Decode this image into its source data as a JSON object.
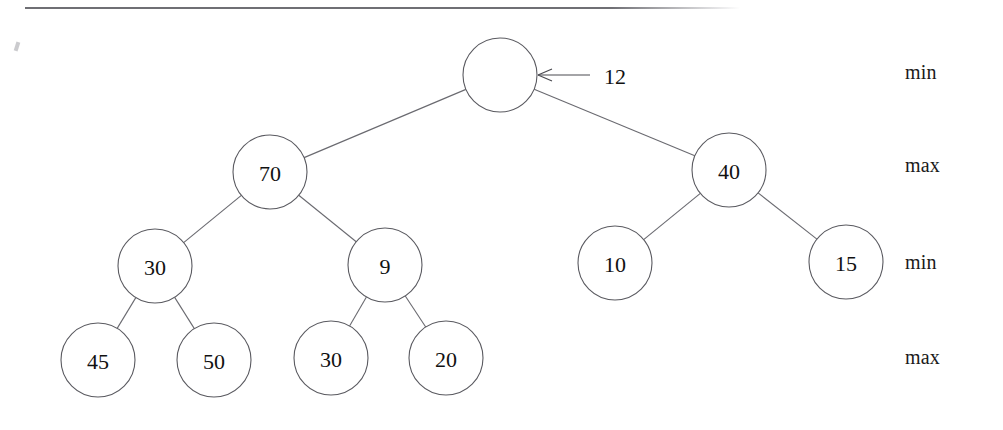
{
  "figure": {
    "background_color": "#ffffff",
    "node_stroke_color": "#5a5a60",
    "edge_stroke_color": "#6a6a70",
    "text_color": "#111111",
    "rule_color": "#6f6f74"
  },
  "pointer": {
    "label": "12",
    "target_node": "root",
    "arrow_direction": "left"
  },
  "level_labels": [
    {
      "text": "min",
      "y": 73
    },
    {
      "text": "max",
      "y": 166
    },
    {
      "text": "min",
      "y": 263
    },
    {
      "text": "max",
      "y": 358
    }
  ],
  "nodes": [
    {
      "id": "root",
      "label": "",
      "cx": 500,
      "cy": 75,
      "r": 37,
      "level": 0
    },
    {
      "id": "n70",
      "label": "70",
      "cx": 270,
      "cy": 172,
      "r": 37,
      "level": 1
    },
    {
      "id": "n40",
      "label": "40",
      "cx": 729,
      "cy": 170,
      "r": 37,
      "level": 1
    },
    {
      "id": "n30a",
      "label": "30",
      "cx": 155,
      "cy": 266,
      "r": 37,
      "level": 2
    },
    {
      "id": "n9",
      "label": "9",
      "cx": 385,
      "cy": 265,
      "r": 37,
      "level": 2
    },
    {
      "id": "n10",
      "label": "10",
      "cx": 615,
      "cy": 263,
      "r": 37,
      "level": 2
    },
    {
      "id": "n15",
      "label": "15",
      "cx": 846,
      "cy": 262,
      "r": 37,
      "level": 2
    },
    {
      "id": "n45",
      "label": "45",
      "cx": 98,
      "cy": 360,
      "r": 37,
      "level": 3
    },
    {
      "id": "n50",
      "label": "50",
      "cx": 214,
      "cy": 360,
      "r": 37,
      "level": 3
    },
    {
      "id": "n30b",
      "label": "30",
      "cx": 331,
      "cy": 358,
      "r": 37,
      "level": 3
    },
    {
      "id": "n20",
      "label": "20",
      "cx": 446,
      "cy": 358,
      "r": 37,
      "level": 3
    }
  ],
  "edges": [
    {
      "from": "root",
      "to": "n70"
    },
    {
      "from": "root",
      "to": "n40"
    },
    {
      "from": "n70",
      "to": "n30a"
    },
    {
      "from": "n70",
      "to": "n9"
    },
    {
      "from": "n40",
      "to": "n10"
    },
    {
      "from": "n40",
      "to": "n15"
    },
    {
      "from": "n30a",
      "to": "n45"
    },
    {
      "from": "n30a",
      "to": "n50"
    },
    {
      "from": "n9",
      "to": "n30b"
    },
    {
      "from": "n9",
      "to": "n20"
    }
  ]
}
